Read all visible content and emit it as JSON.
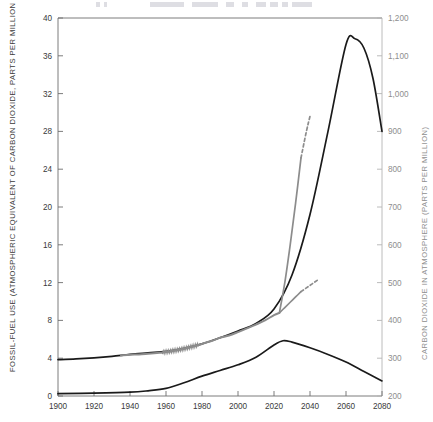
{
  "figure": {
    "title_faint": "",
    "background": "#ffffff"
  },
  "axes": {
    "left": {
      "title": "FOSSIL-FUEL USE (ATMOSPHERIC EQUIVALENT OF CARBON DIOXIDE, PARTS PER MILLION PER YEAR)",
      "ticks": [
        "0",
        "4",
        "8",
        "12",
        "16",
        "20",
        "24",
        "28",
        "32",
        "36",
        "40"
      ],
      "min": 0,
      "max": 40,
      "step": 4,
      "color": "#3a3a3a"
    },
    "right": {
      "title": "CARBON DIOXIDE IN ATMOSPHERE (PARTS PER MILLION)",
      "ticks": [
        "200",
        "300",
        "400",
        "500",
        "600",
        "700",
        "800",
        "900",
        "1,000",
        "1,100",
        "1,200"
      ],
      "min": 200,
      "max": 1200,
      "step": 100,
      "color": "#8e8e8e"
    },
    "bottom": {
      "title": "",
      "ticks": [
        "1900",
        "1920",
        "1940",
        "1960",
        "1980",
        "2000",
        "2020",
        "2040",
        "2060",
        "2080"
      ],
      "min": 1900,
      "max": 2080,
      "step": 20,
      "color": "#3a3a3a"
    }
  },
  "colors": {
    "black_curve": "#1a1a1a",
    "gray_curve": "#8c8c8c",
    "frame": "#6e6e6e",
    "right_frame": "#b4b4b4"
  },
  "chart_data": {
    "type": "line",
    "title": "",
    "xlabel": "",
    "ylabel": "FOSSIL-FUEL USE (ATMOSPHERIC EQUIVALENT OF CARBON DIOXIDE, PARTS PER MILLION PER YEAR)",
    "y2label": "CARBON DIOXIDE IN ATMOSPHERE (PARTS PER MILLION)",
    "xlim": [
      1900,
      2080
    ],
    "ylim": [
      0,
      40
    ],
    "y2lim": [
      200,
      1200
    ],
    "grid": false,
    "legend": "none",
    "series": [
      {
        "name": "atmospheric-co2-projection",
        "axis": "right",
        "color": "#1a1a1a",
        "style": "solid",
        "width": 1.7,
        "x": [
          1900,
          1910,
          1920,
          1930,
          1940,
          1950,
          1960,
          1970,
          1980,
          1990,
          2000,
          2010,
          2020,
          2030,
          2040,
          2050,
          2060,
          2065,
          2070,
          2075,
          2080
        ],
        "y": [
          296,
          298,
          301,
          305,
          310,
          314,
          318,
          326,
          338,
          354,
          372,
          392,
          430,
          520,
          680,
          900,
          1130,
          1145,
          1120,
          1040,
          900
        ]
      },
      {
        "name": "fossil-fuel-use-projection",
        "axis": "left",
        "color": "#1a1a1a",
        "style": "solid",
        "width": 1.7,
        "x": [
          1900,
          1920,
          1940,
          1950,
          1960,
          1970,
          1980,
          1990,
          2000,
          2010,
          2020,
          2025,
          2030,
          2040,
          2050,
          2060,
          2070,
          2080
        ],
        "y": [
          0.25,
          0.3,
          0.4,
          0.55,
          0.8,
          1.4,
          2.1,
          2.7,
          3.3,
          4.1,
          5.4,
          5.85,
          5.7,
          5.1,
          4.4,
          3.6,
          2.6,
          1.6
        ]
      },
      {
        "name": "observed-co2-record",
        "axis": "right",
        "color": "#8c8c8c",
        "style": "solid",
        "width": 2.0,
        "x": [
          1935,
          1940,
          1945,
          1950,
          1955,
          1958,
          1962,
          1966,
          1970,
          1974,
          1978,
          1982,
          1986,
          1990,
          1995,
          2000,
          2005,
          2010,
          2015,
          2020,
          2023
        ],
        "y": [
          307,
          309,
          310,
          312,
          314,
          315,
          318,
          321,
          325,
          330,
          335,
          341,
          347,
          354,
          360,
          369,
          379,
          389,
          400,
          414,
          420
        ],
        "note": "sawtooth seasonal oscillation drawn between 1958 and 1978"
      },
      {
        "name": "co2-high-scenario",
        "axis": "right",
        "color": "#8c8c8c",
        "style": "solid",
        "width": 1.7,
        "x": [
          2023,
          2026,
          2029,
          2032,
          2035
        ],
        "y": [
          420,
          500,
          600,
          710,
          830
        ]
      },
      {
        "name": "co2-high-scenario-dashed",
        "axis": "right",
        "color": "#8c8c8c",
        "style": "dashed",
        "width": 1.7,
        "x": [
          2035,
          2038,
          2040
        ],
        "y": [
          830,
          900,
          940
        ]
      },
      {
        "name": "co2-low-scenario",
        "axis": "right",
        "color": "#8c8c8c",
        "style": "solid",
        "width": 1.7,
        "x": [
          2023,
          2026,
          2029,
          2032,
          2035
        ],
        "y": [
          420,
          434,
          448,
          462,
          476
        ]
      },
      {
        "name": "co2-low-scenario-dashed",
        "axis": "right",
        "color": "#8c8c8c",
        "style": "dashed",
        "width": 1.7,
        "x": [
          2035,
          2038,
          2041,
          2044
        ],
        "y": [
          476,
          486,
          496,
          506
        ]
      }
    ],
    "sawtooth": {
      "start_year": 1958,
      "end_year": 1978,
      "cycles": 20,
      "amplitude_ppm": 9
    }
  }
}
